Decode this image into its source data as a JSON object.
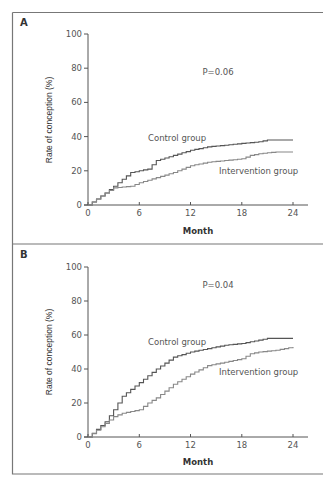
{
  "chart_data": [
    {
      "panel": "A",
      "type": "line",
      "subtype": "step (Kaplan-Meier style cumulative incidence)",
      "title": "",
      "xlabel": "Month",
      "ylabel": "Rate of conception (%)",
      "xlim": [
        0,
        24
      ],
      "ylim": [
        0,
        100
      ],
      "x_ticks": [
        0,
        6,
        12,
        18,
        24
      ],
      "y_ticks": [
        0,
        20,
        40,
        60,
        80,
        100
      ],
      "grid": false,
      "annotation": "P=0.06",
      "series": [
        {
          "name": "Control group",
          "x": [
            0,
            2,
            4,
            5,
            6,
            7,
            8,
            10,
            12,
            14,
            16,
            18,
            20,
            21,
            22,
            24
          ],
          "y": [
            0,
            7,
            15,
            19,
            20,
            21,
            26,
            29,
            32,
            34,
            35,
            36,
            37,
            38,
            38,
            38
          ]
        },
        {
          "name": "Intervention group",
          "x": [
            0,
            2,
            3,
            5,
            6,
            8,
            10,
            12,
            14,
            16,
            18,
            19,
            20,
            22,
            24
          ],
          "y": [
            0,
            7,
            10,
            11,
            13,
            16,
            19,
            23,
            25,
            26,
            27,
            29,
            30,
            31,
            31
          ]
        }
      ]
    },
    {
      "panel": "B",
      "type": "line",
      "subtype": "step (Kaplan-Meier style cumulative incidence)",
      "title": "",
      "xlabel": "Month",
      "ylabel": "Rate of conception (%)",
      "xlim": [
        0,
        24
      ],
      "ylim": [
        0,
        100
      ],
      "x_ticks": [
        0,
        6,
        12,
        18,
        24
      ],
      "y_ticks": [
        0,
        20,
        40,
        60,
        80,
        100
      ],
      "grid": false,
      "annotation": "P=0.04",
      "series": [
        {
          "name": "Control group",
          "x": [
            0,
            2,
            3,
            4,
            5,
            6,
            8,
            10,
            12,
            14,
            16,
            18,
            20,
            21,
            24
          ],
          "y": [
            0,
            9,
            16,
            24,
            28,
            32,
            40,
            47,
            50,
            52,
            54,
            55,
            57,
            58,
            58
          ]
        },
        {
          "name": "Intervention group",
          "x": [
            0,
            2,
            3,
            4,
            5,
            6,
            7,
            8,
            10,
            12,
            14,
            16,
            18,
            19,
            20,
            22,
            24
          ],
          "y": [
            0,
            8,
            12,
            14,
            15,
            16,
            20,
            23,
            31,
            37,
            42,
            44,
            46,
            49,
            50,
            51,
            53
          ]
        }
      ]
    }
  ],
  "panels": [
    {
      "letter": "A",
      "p_value": "P=0.06",
      "ylabel": "Rate of conception (%)",
      "xlabel": "Month",
      "x_tick_labels": [
        "0",
        "6",
        "12",
        "18",
        "24"
      ],
      "y_tick_labels": [
        "0",
        "20",
        "40",
        "60",
        "80",
        "100"
      ],
      "labels": {
        "control": "Control group",
        "intervention": "Intervention group"
      }
    },
    {
      "letter": "B",
      "p_value": "P=0.04",
      "ylabel": "Rate of conception (%)",
      "xlabel": "Month",
      "x_tick_labels": [
        "0",
        "6",
        "12",
        "18",
        "24"
      ],
      "y_tick_labels": [
        "0",
        "20",
        "40",
        "60",
        "80",
        "100"
      ],
      "labels": {
        "control": "Control group",
        "intervention": "Intervention group"
      }
    }
  ],
  "colors": {
    "control_line": "#555555",
    "intervention_line": "#888888",
    "axis": "#555555",
    "frame": "#777777"
  }
}
